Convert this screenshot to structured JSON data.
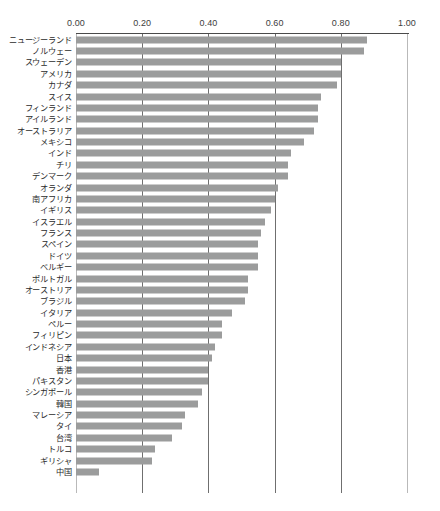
{
  "figure": {
    "top_artifact_text": "",
    "bar_color": "#9b9c9c",
    "axis_color": "#4a4a4a",
    "gridline_color": "#b9b9b9",
    "label_color": "#2b2b2b"
  },
  "chart_data": {
    "type": "bar",
    "orientation": "horizontal",
    "title": "",
    "xlabel": "",
    "ylabel": "",
    "xlim": [
      0.0,
      1.0
    ],
    "grid": true,
    "legend": "none",
    "axis_position": "top",
    "sorted": "descending",
    "tick_labels": [
      "0.00",
      "0.20",
      "0.40",
      "0.60",
      "0.80",
      "1.00"
    ],
    "ticks": [
      0.0,
      0.2,
      0.4,
      0.6,
      0.8,
      1.0
    ],
    "categories": [
      "ニュージーランド",
      "ノルウェー",
      "スウェーデン",
      "アメリカ",
      "カナダ",
      "スイス",
      "フィンランド",
      "アイルランド",
      "オーストラリア",
      "メキシコ",
      "インド",
      "チリ",
      "デンマーク",
      "オランダ",
      "南アフリカ",
      "イギリス",
      "イスラエル",
      "フランス",
      "スペイン",
      "ドイツ",
      "ベルギー",
      "ポルトガル",
      "オーストリア",
      "ブラジル",
      "イタリア",
      "ペルー",
      "フィリピン",
      "インドネシア",
      "日本",
      "香港",
      "パキスタン",
      "シンガポール",
      "韓国",
      "マレーシア",
      "タイ",
      "台湾",
      "トルコ",
      "ギリシャ",
      "中国"
    ],
    "values": [
      0.88,
      0.87,
      0.8,
      0.8,
      0.79,
      0.74,
      0.73,
      0.73,
      0.72,
      0.69,
      0.65,
      0.64,
      0.64,
      0.61,
      0.6,
      0.59,
      0.57,
      0.56,
      0.55,
      0.55,
      0.55,
      0.52,
      0.52,
      0.51,
      0.47,
      0.44,
      0.44,
      0.42,
      0.41,
      0.4,
      0.4,
      0.38,
      0.37,
      0.33,
      0.32,
      0.29,
      0.24,
      0.23,
      0.07
    ]
  }
}
